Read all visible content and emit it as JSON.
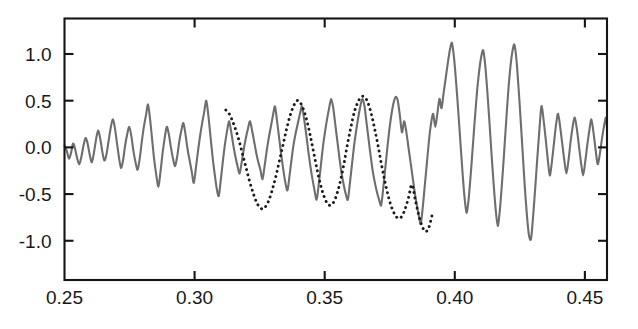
{
  "chart_data": {
    "type": "line",
    "title": "",
    "subtitle": "",
    "xlabel": "",
    "ylabel": "",
    "xlim": [
      0.25,
      0.4585
    ],
    "ylim": [
      -1.42,
      1.38
    ],
    "grid": false,
    "legend_position": "none",
    "xticks": [
      0.25,
      0.3,
      0.35,
      0.4,
      0.45
    ],
    "xtick_labels": [
      "0.25",
      "0.30",
      "0.35",
      "0.40",
      "0.45"
    ],
    "yticks": [
      1.0,
      0.5,
      0.0,
      -0.5,
      -1.0
    ],
    "ytick_labels": [
      "1.0",
      "0.5",
      "0.0",
      "-0.5",
      "-1.0"
    ],
    "ticks_mirrored": true,
    "frame": "box",
    "annotations": [],
    "series": [
      {
        "name": "observed-seismogram",
        "style": "solid",
        "color": "#6e6e6e",
        "x": [
          0.25,
          0.2509,
          0.2517,
          0.2525,
          0.2533,
          0.2541,
          0.2549,
          0.2557,
          0.2565,
          0.2573,
          0.2581,
          0.2589,
          0.2597,
          0.2605,
          0.2613,
          0.2621,
          0.2629,
          0.2637,
          0.2645,
          0.2653,
          0.2661,
          0.2669,
          0.2677,
          0.2685,
          0.2693,
          0.2701,
          0.2709,
          0.2717,
          0.2725,
          0.2733,
          0.2741,
          0.2749,
          0.2757,
          0.2765,
          0.2773,
          0.2781,
          0.2789,
          0.2797,
          0.2805,
          0.2813,
          0.2821,
          0.2829,
          0.2837,
          0.2845,
          0.2853,
          0.2861,
          0.2869,
          0.2877,
          0.2885,
          0.2893,
          0.2901,
          0.2909,
          0.2917,
          0.2925,
          0.2933,
          0.2941,
          0.2949,
          0.2957,
          0.2965,
          0.2973,
          0.2981,
          0.2989,
          0.2997,
          0.3005,
          0.3013,
          0.3021,
          0.3029,
          0.3037,
          0.3045,
          0.3053,
          0.3061,
          0.3069,
          0.3077,
          0.3085,
          0.3093,
          0.3101,
          0.3109,
          0.3117,
          0.3125,
          0.3133,
          0.3141,
          0.3149,
          0.3157,
          0.3165,
          0.3173,
          0.3181,
          0.3189,
          0.3197,
          0.3205,
          0.3213,
          0.3221,
          0.3229,
          0.3237,
          0.3245,
          0.3253,
          0.3261,
          0.3269,
          0.3277,
          0.3285,
          0.3293,
          0.3301,
          0.3309,
          0.3317,
          0.3325,
          0.3333,
          0.3341,
          0.3349,
          0.3357,
          0.3365,
          0.3373,
          0.3381,
          0.3389,
          0.3397,
          0.3405,
          0.3413,
          0.3421,
          0.3429,
          0.3437,
          0.3445,
          0.3453,
          0.3461,
          0.3469,
          0.3477,
          0.3485,
          0.3493,
          0.3501,
          0.3509,
          0.3517,
          0.3525,
          0.3533,
          0.3541,
          0.3549,
          0.3557,
          0.3565,
          0.3573,
          0.3581,
          0.3589,
          0.3597,
          0.3605,
          0.3613,
          0.3621,
          0.3629,
          0.3637,
          0.3645,
          0.3653,
          0.3661,
          0.3669,
          0.3677,
          0.3685,
          0.3693,
          0.3701,
          0.3709,
          0.3717,
          0.3725,
          0.3733,
          0.3741,
          0.3749,
          0.3757,
          0.3765,
          0.3773,
          0.3781,
          0.3789,
          0.3797,
          0.3805,
          0.3813,
          0.3821,
          0.3829,
          0.3837,
          0.3845,
          0.3853,
          0.3861,
          0.3869,
          0.3877,
          0.3885,
          0.3893,
          0.3901,
          0.3909,
          0.3917,
          0.3925,
          0.3933,
          0.3941,
          0.3949,
          0.3957,
          0.3965,
          0.3973,
          0.3981,
          0.3989,
          0.3997,
          0.4005,
          0.4013,
          0.4021,
          0.4029,
          0.4037,
          0.4045,
          0.4053,
          0.4061,
          0.4069,
          0.4077,
          0.4085,
          0.4093,
          0.4101,
          0.4109,
          0.4117,
          0.4125,
          0.4133,
          0.4141,
          0.4149,
          0.4157,
          0.4165,
          0.4173,
          0.4181,
          0.4189,
          0.4197,
          0.4205,
          0.4213,
          0.4221,
          0.4229,
          0.4237,
          0.4245,
          0.4253,
          0.4261,
          0.4269,
          0.4277,
          0.4285,
          0.4293,
          0.4301,
          0.4309,
          0.4317,
          0.4325,
          0.4333,
          0.4341,
          0.4349,
          0.4357,
          0.4365,
          0.4373,
          0.4381,
          0.4389,
          0.4397,
          0.4405,
          0.4413,
          0.4421,
          0.4429,
          0.4437,
          0.4445,
          0.4453,
          0.4461,
          0.4469,
          0.4477,
          0.4485,
          0.4493,
          0.4501,
          0.4509,
          0.4517,
          0.4525,
          0.4533,
          0.4541,
          0.4549,
          0.4557,
          0.4565,
          0.4573,
          0.4581,
          0.4585
        ],
        "y": [
          0.02,
          -0.04,
          -0.12,
          -0.06,
          0.04,
          -0.02,
          -0.12,
          -0.18,
          -0.1,
          0.02,
          0.1,
          0.04,
          -0.08,
          -0.16,
          -0.06,
          0.08,
          0.18,
          0.1,
          -0.04,
          -0.14,
          -0.08,
          0.06,
          0.2,
          0.3,
          0.22,
          0.06,
          -0.1,
          -0.22,
          -0.14,
          0.02,
          0.14,
          0.22,
          0.12,
          -0.04,
          -0.16,
          -0.24,
          -0.12,
          0.06,
          0.22,
          0.34,
          0.46,
          0.3,
          0.08,
          -0.14,
          -0.3,
          -0.42,
          -0.26,
          -0.06,
          0.1,
          0.22,
          0.14,
          0.0,
          -0.12,
          -0.2,
          -0.1,
          0.06,
          0.18,
          0.26,
          0.14,
          -0.02,
          -0.14,
          -0.26,
          -0.38,
          -0.22,
          -0.04,
          0.12,
          0.26,
          0.38,
          0.5,
          0.34,
          0.12,
          -0.1,
          -0.28,
          -0.44,
          -0.52,
          -0.34,
          -0.14,
          0.04,
          0.18,
          0.28,
          0.16,
          0.02,
          -0.1,
          -0.2,
          -0.28,
          -0.16,
          -0.02,
          0.1,
          0.2,
          0.28,
          0.18,
          0.06,
          -0.06,
          -0.16,
          -0.24,
          -0.34,
          -0.2,
          -0.04,
          0.1,
          0.22,
          0.34,
          0.44,
          0.28,
          0.1,
          -0.08,
          -0.24,
          -0.38,
          -0.46,
          -0.3,
          -0.12,
          0.04,
          0.16,
          0.26,
          0.36,
          0.44,
          0.3,
          0.14,
          -0.04,
          -0.2,
          -0.34,
          -0.46,
          -0.56,
          -0.4,
          -0.2,
          0.0,
          0.16,
          0.3,
          0.42,
          0.52,
          0.42,
          0.24,
          0.06,
          -0.12,
          -0.28,
          -0.4,
          -0.5,
          -0.56,
          -0.38,
          -0.18,
          0.02,
          0.18,
          0.32,
          0.44,
          0.52,
          0.44,
          0.26,
          0.08,
          -0.1,
          -0.26,
          -0.38,
          -0.48,
          -0.56,
          -0.62,
          -0.44,
          -0.22,
          0.0,
          0.2,
          0.36,
          0.48,
          0.54,
          0.5,
          0.34,
          0.16,
          0.28,
          0.18,
          0.02,
          -0.14,
          -0.3,
          -0.46,
          -0.6,
          -0.72,
          -0.82,
          -0.64,
          -0.4,
          -0.16,
          0.08,
          0.26,
          0.36,
          0.22,
          0.36,
          0.52,
          0.42,
          0.58,
          0.74,
          0.9,
          1.04,
          1.12,
          0.96,
          0.7,
          0.4,
          0.08,
          -0.24,
          -0.52,
          -0.7,
          -0.56,
          -0.3,
          0.0,
          0.3,
          0.58,
          0.8,
          0.96,
          1.04,
          0.88,
          0.6,
          0.28,
          -0.06,
          -0.38,
          -0.66,
          -0.84,
          -0.68,
          -0.4,
          -0.08,
          0.26,
          0.58,
          0.84,
          1.02,
          1.1,
          0.94,
          0.64,
          0.3,
          -0.06,
          -0.42,
          -0.72,
          -0.94,
          -0.98,
          -0.74,
          -0.44,
          -0.12,
          0.18,
          0.44,
          0.3,
          0.1,
          -0.12,
          -0.3,
          -0.16,
          0.04,
          0.24,
          0.36,
          0.22,
          0.04,
          -0.14,
          -0.28,
          -0.14,
          0.06,
          0.22,
          0.32,
          0.2,
          0.02,
          -0.16,
          -0.3,
          -0.16,
          0.02,
          0.18,
          0.3,
          0.16,
          -0.02,
          -0.18,
          -0.08,
          0.08,
          0.22,
          0.32,
          0.2
        ]
      },
      {
        "name": "synthetic-fit",
        "style": "dotted",
        "color": "#1c1c1c",
        "x": [
          0.312,
          0.3133,
          0.3146,
          0.3159,
          0.3172,
          0.3185,
          0.3198,
          0.3211,
          0.3224,
          0.3237,
          0.325,
          0.3263,
          0.3276,
          0.3289,
          0.3302,
          0.3315,
          0.3328,
          0.3341,
          0.3354,
          0.3367,
          0.338,
          0.3393,
          0.3406,
          0.3419,
          0.3432,
          0.3445,
          0.3458,
          0.3471,
          0.3484,
          0.3497,
          0.351,
          0.3523,
          0.3536,
          0.3549,
          0.3562,
          0.3575,
          0.3588,
          0.3601,
          0.3614,
          0.3627,
          0.364,
          0.3653,
          0.3666,
          0.3679,
          0.3692,
          0.3705,
          0.3718,
          0.3731,
          0.3744,
          0.3757,
          0.377,
          0.3783,
          0.3796,
          0.3809,
          0.3822,
          0.3835,
          0.3848,
          0.3861,
          0.3874,
          0.3887,
          0.39,
          0.3915
        ],
        "y": [
          0.4,
          0.36,
          0.28,
          0.18,
          0.06,
          -0.08,
          -0.22,
          -0.36,
          -0.48,
          -0.58,
          -0.64,
          -0.66,
          -0.62,
          -0.54,
          -0.42,
          -0.28,
          -0.12,
          0.04,
          0.2,
          0.34,
          0.44,
          0.5,
          0.48,
          0.4,
          0.28,
          0.12,
          -0.06,
          -0.24,
          -0.4,
          -0.52,
          -0.6,
          -0.62,
          -0.58,
          -0.48,
          -0.34,
          -0.16,
          0.04,
          0.22,
          0.38,
          0.48,
          0.54,
          0.54,
          0.48,
          0.36,
          0.2,
          0.02,
          -0.18,
          -0.36,
          -0.52,
          -0.64,
          -0.72,
          -0.76,
          -0.74,
          -0.66,
          -0.54,
          -0.4,
          -0.56,
          -0.72,
          -0.84,
          -0.9,
          -0.86,
          -0.7
        ]
      }
    ]
  },
  "figure": {
    "background_color": "#ffffff",
    "axis_color": "#151515",
    "solid_series_color": "#6e6e6e",
    "dotted_series_color": "#1c1c1c"
  }
}
